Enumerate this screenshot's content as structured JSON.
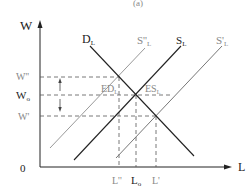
{
  "figure": {
    "caption_partial": "(a)",
    "axes": {
      "y_label": "W",
      "x_label": "L",
      "origin_label": "0"
    },
    "y_ticks": [
      {
        "label": "W''",
        "role": "raised wage"
      },
      {
        "label": "Wo",
        "role": "equilibrium wage"
      },
      {
        "label": "W'",
        "role": "lowered wage"
      }
    ],
    "x_ticks": [
      {
        "label": "L''"
      },
      {
        "label": "Lo"
      },
      {
        "label": "L'"
      }
    ],
    "curves": [
      {
        "name": "DL",
        "label": "D",
        "sub": "L",
        "type": "demand",
        "color": "#222222"
      },
      {
        "name": "S''L",
        "label": "S''",
        "sub": "L",
        "type": "supply-shifted-left",
        "color": "#999999"
      },
      {
        "name": "SL",
        "label": "S",
        "sub": "L",
        "type": "supply",
        "color": "#222222"
      },
      {
        "name": "S'L",
        "label": "S'",
        "sub": "L",
        "type": "supply-shifted-right",
        "color": "#777777"
      }
    ],
    "annotations": {
      "excess_demand": "ED",
      "excess_demand_sub": "L",
      "excess_supply": "ES",
      "excess_supply_sub": "L"
    }
  }
}
